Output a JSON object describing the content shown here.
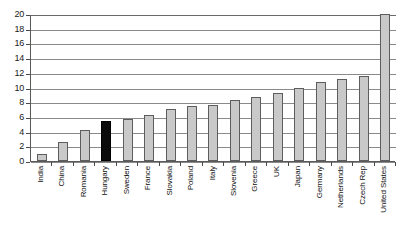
{
  "chart_data": {
    "type": "bar",
    "title": "",
    "subtitle": "",
    "xlabel": "",
    "ylabel": "",
    "ylim": [
      0,
      20
    ],
    "ytick_step": 2,
    "ytick_labels": [
      "20",
      "18",
      "16",
      "14",
      "12",
      "10",
      "8",
      "6",
      "4",
      "2",
      "0"
    ],
    "grid": true,
    "legend": "none",
    "categories": [
      "India",
      "China",
      "Romania",
      "Hungary",
      "Sweden",
      "France",
      "Slovakia",
      "Poland",
      "Italy",
      "Slovenia",
      "Greece",
      "UK",
      "Japan",
      "Germany",
      "Netherlands",
      "Czech Rep",
      "United States"
    ],
    "values": [
      1.0,
      2.6,
      4.2,
      5.5,
      5.7,
      6.3,
      7.1,
      7.5,
      7.6,
      8.3,
      8.7,
      9.3,
      9.9,
      10.8,
      11.1,
      11.5,
      20.0
    ],
    "bar_colors": [
      "#c9c9c9",
      "#c9c9c9",
      "#c9c9c9",
      "#0b0b0b",
      "#c9c9c9",
      "#c9c9c9",
      "#c9c9c9",
      "#c9c9c9",
      "#c9c9c9",
      "#c9c9c9",
      "#c9c9c9",
      "#c9c9c9",
      "#c9c9c9",
      "#c9c9c9",
      "#c9c9c9",
      "#c9c9c9",
      "#c9c9c9"
    ],
    "highlight_category": "Hungary",
    "highlight_color": "#0b0b0b",
    "default_bar_color": "#c9c9c9",
    "bar_border_color": "#5d5d5d",
    "gridline_color": "#8a8a8a",
    "axis_color": "#5a5a5a"
  }
}
